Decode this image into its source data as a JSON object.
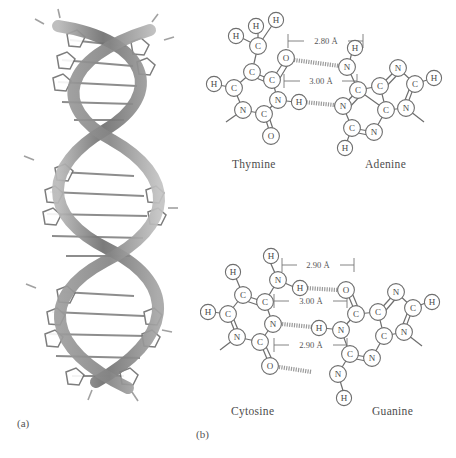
{
  "figure": {
    "panels": [
      {
        "id": "a",
        "label": "(a)",
        "caption": "DNA double helix"
      },
      {
        "id": "b",
        "label": "(b)",
        "caption": "Base pairing"
      }
    ]
  },
  "helix": {
    "name": "dna-double-helix",
    "strand_color": "#8c8c8c",
    "rung_color": "#6f6f6f",
    "turns": 3
  },
  "base_pairs": [
    {
      "id": "at",
      "left_base": "Thymine",
      "right_base": "Adenine",
      "hydrogen_bonds": [
        {
          "label": "2.80 Å",
          "donor": "N",
          "acceptor": "O"
        },
        {
          "label": "3.00 Å",
          "donor": "N",
          "acceptor": "N"
        }
      ],
      "left_atoms": [
        {
          "el": "H",
          "x": 36,
          "y": 26
        },
        {
          "el": "H",
          "x": 56,
          "y": 16
        },
        {
          "el": "H",
          "x": 76,
          "y": 10
        },
        {
          "el": "C",
          "x": 58,
          "y": 36
        },
        {
          "el": "C",
          "x": 52,
          "y": 62
        },
        {
          "el": "C",
          "x": 72,
          "y": 70
        },
        {
          "el": "O",
          "x": 85,
          "y": 50
        },
        {
          "el": "C",
          "x": 34,
          "y": 78
        },
        {
          "el": "H",
          "x": 14,
          "y": 74
        },
        {
          "el": "N",
          "x": 43,
          "y": 100
        },
        {
          "el": "C",
          "x": 64,
          "y": 104
        },
        {
          "el": "N",
          "x": 78,
          "y": 90
        },
        {
          "el": "O",
          "x": 71,
          "y": 126
        },
        {
          "el": "H",
          "x": 99,
          "y": 92
        }
      ],
      "right_atoms": [
        {
          "el": "H",
          "x": 155,
          "y": 40
        },
        {
          "el": "N",
          "x": 148,
          "y": 58
        },
        {
          "el": "C",
          "x": 158,
          "y": 80
        },
        {
          "el": "N",
          "x": 143,
          "y": 96
        },
        {
          "el": "C",
          "x": 152,
          "y": 118
        },
        {
          "el": "N",
          "x": 174,
          "y": 122
        },
        {
          "el": "H",
          "x": 146,
          "y": 138
        },
        {
          "el": "C",
          "x": 180,
          "y": 76
        },
        {
          "el": "N",
          "x": 198,
          "y": 58
        },
        {
          "el": "C",
          "x": 215,
          "y": 74
        },
        {
          "el": "H",
          "x": 234,
          "y": 68
        },
        {
          "el": "N",
          "x": 206,
          "y": 98
        },
        {
          "el": "C",
          "x": 186,
          "y": 100
        }
      ]
    },
    {
      "id": "cg",
      "left_base": "Cytosine",
      "right_base": "Guanine",
      "hydrogen_bonds": [
        {
          "label": "2.90 Å",
          "donor": "N",
          "acceptor": "O"
        },
        {
          "label": "3.00 Å",
          "donor": "N",
          "acceptor": "N"
        },
        {
          "label": "2.90 Å",
          "donor": "N",
          "acceptor": "O"
        }
      ],
      "left_atoms": [
        {
          "el": "H",
          "x": 71,
          "y": 24
        },
        {
          "el": "N",
          "x": 78,
          "y": 48
        },
        {
          "el": "H",
          "x": 100,
          "y": 56
        },
        {
          "el": "H",
          "x": 33,
          "y": 40
        },
        {
          "el": "C",
          "x": 43,
          "y": 63
        },
        {
          "el": "C",
          "x": 65,
          "y": 70
        },
        {
          "el": "C",
          "x": 28,
          "y": 82
        },
        {
          "el": "H",
          "x": 7,
          "y": 80
        },
        {
          "el": "N",
          "x": 37,
          "y": 105
        },
        {
          "el": "C",
          "x": 60,
          "y": 110
        },
        {
          "el": "N",
          "x": 73,
          "y": 92
        },
        {
          "el": "O",
          "x": 70,
          "y": 134
        }
      ],
      "right_atoms": [
        {
          "el": "O",
          "x": 146,
          "y": 58
        },
        {
          "el": "C",
          "x": 156,
          "y": 82
        },
        {
          "el": "N",
          "x": 141,
          "y": 98
        },
        {
          "el": "H",
          "x": 119,
          "y": 96
        },
        {
          "el": "C",
          "x": 150,
          "y": 122
        },
        {
          "el": "N",
          "x": 172,
          "y": 126
        },
        {
          "el": "N",
          "x": 138,
          "y": 142
        },
        {
          "el": "H",
          "x": 144,
          "y": 166
        },
        {
          "el": "C",
          "x": 178,
          "y": 80
        },
        {
          "el": "N",
          "x": 196,
          "y": 60
        },
        {
          "el": "C",
          "x": 213,
          "y": 76
        },
        {
          "el": "H",
          "x": 232,
          "y": 70
        },
        {
          "el": "N",
          "x": 204,
          "y": 100
        },
        {
          "el": "C",
          "x": 184,
          "y": 104
        }
      ]
    }
  ]
}
